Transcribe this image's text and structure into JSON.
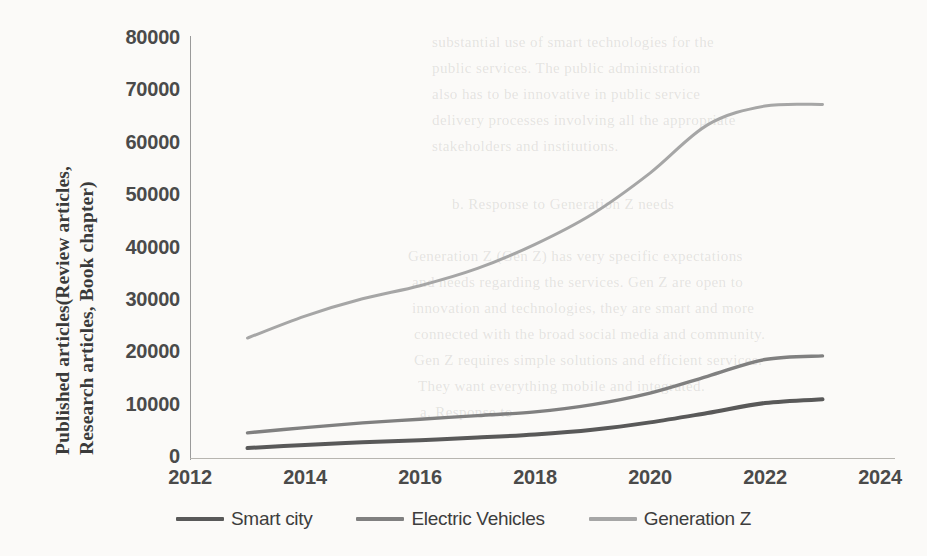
{
  "chart_data": {
    "type": "line",
    "title": "",
    "xlabel": "",
    "ylabel": "Published articles(Review articles, Research articles, Book chapter)",
    "ylabel_line1": "Published articles(Review articles,",
    "ylabel_line2": "Research articles, Book chapter)",
    "xlim": [
      2012,
      2024
    ],
    "ylim": [
      0,
      80000
    ],
    "xticks": [
      2012,
      2014,
      2016,
      2018,
      2020,
      2022,
      2024
    ],
    "yticks": [
      0,
      10000,
      20000,
      30000,
      40000,
      50000,
      60000,
      70000,
      80000
    ],
    "xtick_labels": [
      "2012",
      "2014",
      "2016",
      "2018",
      "2020",
      "2022",
      "2024"
    ],
    "ytick_labels": [
      "0",
      "10000",
      "20000",
      "30000",
      "40000",
      "50000",
      "60000",
      "70000",
      "80000"
    ],
    "grid": false,
    "legend_position": "bottom",
    "x": [
      2013,
      2014,
      2015,
      2016,
      2017,
      2018,
      2019,
      2020,
      2021,
      2022,
      2023
    ],
    "series": [
      {
        "name": "Smart city",
        "color": "#595959",
        "width": 4.0,
        "values": [
          1900,
          2500,
          3000,
          3400,
          3900,
          4500,
          5400,
          6800,
          8600,
          10500,
          11200
        ]
      },
      {
        "name": "Electric Vehicles",
        "color": "#808080",
        "width": 3.4,
        "values": [
          4800,
          5800,
          6700,
          7400,
          8100,
          8800,
          10200,
          12400,
          15600,
          18800,
          19500
        ]
      },
      {
        "name": "Generation Z",
        "color": "#a6a6a6",
        "width": 3.0,
        "values": [
          22900,
          27100,
          30400,
          32900,
          36200,
          40800,
          46600,
          54400,
          63600,
          67200,
          67500
        ]
      }
    ]
  },
  "legend": {
    "items": [
      {
        "label": "Smart city",
        "color": "#595959"
      },
      {
        "label": "Electric Vehicles",
        "color": "#808080"
      },
      {
        "label": "Generation Z",
        "color": "#a6a6a6"
      }
    ]
  },
  "background_text": {
    "lines": [
      {
        "text": "substantial use of smart technologies for the",
        "x": 432,
        "y": 34
      },
      {
        "text": "public services. The public administration",
        "x": 432,
        "y": 60
      },
      {
        "text": "also has to be innovative in public service",
        "x": 432,
        "y": 86
      },
      {
        "text": "delivery processes involving all the appropriate",
        "x": 432,
        "y": 112
      },
      {
        "text": "stakeholders and institutions.",
        "x": 432,
        "y": 138
      },
      {
        "text": "b. Response to Generation Z needs",
        "x": 452,
        "y": 196
      },
      {
        "text": "Generation Z (Gen Z) has very specific expectations",
        "x": 408,
        "y": 248
      },
      {
        "text": "and needs regarding the services. Gen Z are open to",
        "x": 412,
        "y": 274
      },
      {
        "text": "innovation and technologies, they are smart and more",
        "x": 412,
        "y": 300
      },
      {
        "text": "connected with the broad social media and community.",
        "x": 414,
        "y": 326
      },
      {
        "text": "Gen Z requires simple solutions and efficient services.",
        "x": 414,
        "y": 352
      },
      {
        "text": "They want everything mobile and integrated.",
        "x": 418,
        "y": 378
      },
      {
        "text": "a. Response to",
        "x": 420,
        "y": 404
      }
    ]
  }
}
